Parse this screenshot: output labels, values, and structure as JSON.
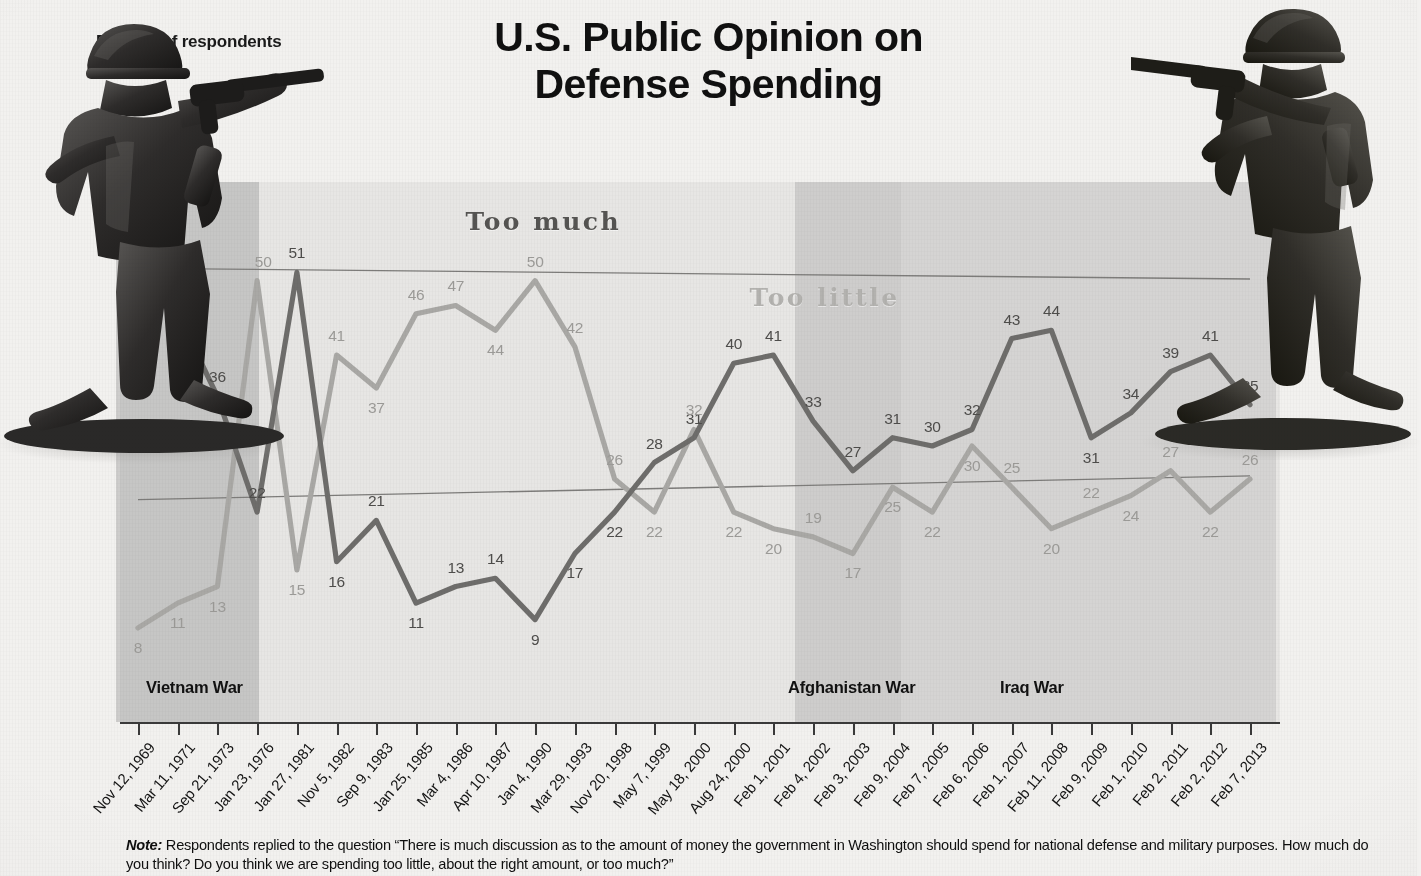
{
  "title": {
    "line1": "U.S. Public Opinion on",
    "line2": "Defense Spending"
  },
  "axis_title": "Percent of respondents",
  "war_bands": [
    {
      "name": "vietnam",
      "label": "Vietnam War"
    },
    {
      "name": "afghanistan",
      "label": "Afghanistan War"
    },
    {
      "name": "iraq",
      "label": "Iraq War"
    }
  ],
  "series_labels": {
    "too_much": "Too much",
    "too_little": "Too little"
  },
  "note": {
    "prefix": "Note:",
    "line1": "Respondents replied to the question “There is much discussion as to the amount of money the government in Washington should spend for national defense",
    "line2": "and military purposes. How much do you think? Do you think we are spending too little, about the right amount, or too much?”"
  },
  "colors": {
    "too_much_line": "#6e6d6b",
    "too_little_line": "#a9a8a5",
    "plot_background": "#e7e6e4",
    "page_background": "#f2f1ef",
    "axis": "#3a3a3a",
    "title_text": "#101010"
  },
  "chart_data": {
    "type": "line",
    "title": "U.S. Public Opinion on Defense Spending",
    "xlabel": "",
    "ylabel": "Percent of respondents",
    "ylim": [
      0,
      60
    ],
    "grid": false,
    "legend": "inline-labels",
    "categories": [
      "Nov 12, 1969",
      "Mar 11, 1971",
      "Sep 21, 1973",
      "Jan 23, 1976",
      "Jan 27, 1981",
      "Nov 5, 1982",
      "Sep 9, 1983",
      "Jan 25, 1985",
      "Mar 4, 1986",
      "Apr 10, 1987",
      "Jan 4, 1990",
      "Mar 29, 1993",
      "Nov 20, 1998",
      "May 7, 1999",
      "May 18, 2000",
      "Aug 24, 2000",
      "Feb 1, 2001",
      "Feb 4, 2002",
      "Feb 3, 2003",
      "Feb 9, 2004",
      "Feb 7, 2005",
      "Feb 6, 2006",
      "Feb 1, 2007",
      "Feb 11, 2008",
      "Feb 9, 2009",
      "Feb 1, 2010",
      "Feb 2, 2011",
      "Feb 2, 2012",
      "Feb 7, 2013"
    ],
    "series": [
      {
        "name": "Too much",
        "color": "#6e6d6b",
        "values": [
          52,
          46,
          36,
          22,
          51,
          16,
          21,
          11,
          13,
          14,
          9,
          17,
          22,
          28,
          31,
          40,
          41,
          33,
          27,
          31,
          30,
          32,
          43,
          44,
          31,
          34,
          39,
          41,
          35
        ]
      },
      {
        "name": "Too little",
        "color": "#a9a8a5",
        "values": [
          8,
          11,
          13,
          50,
          15,
          41,
          37,
          46,
          47,
          44,
          50,
          42,
          26,
          22,
          32,
          22,
          20,
          19,
          17,
          25,
          22,
          30,
          25,
          20,
          22,
          24,
          27,
          22,
          26
        ]
      }
    ],
    "annotations": [
      {
        "text": "Vietnam War",
        "type": "band-label"
      },
      {
        "text": "Afghanistan War",
        "type": "band-label"
      },
      {
        "text": "Iraq War",
        "type": "band-label"
      }
    ]
  }
}
